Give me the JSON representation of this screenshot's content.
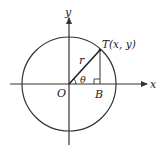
{
  "diagram": {
    "type": "unit-circle-trig",
    "labels": {
      "y_axis": "y",
      "x_axis": "x",
      "origin": "O",
      "point_T": "T(x, y)",
      "point_B": "B",
      "radius": "r",
      "angle": "θ"
    },
    "colors": {
      "stroke": "#333333",
      "background": "#ffffff"
    }
  }
}
